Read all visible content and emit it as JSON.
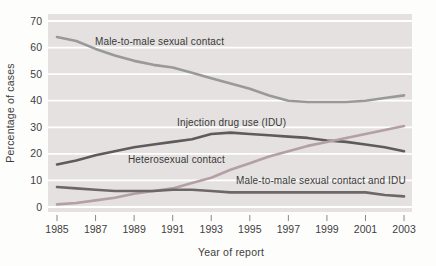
{
  "colors": {
    "page_bg": "#fdfdfc",
    "plot_bg": "#e4e1e0",
    "gridline": "#ffffff",
    "text": "#3f3e3e",
    "tick": "#8a8888"
  },
  "chart_data": {
    "type": "line",
    "xlabel": "Year of report",
    "ylabel": "Percentage of cases",
    "x": [
      1985,
      1986,
      1987,
      1988,
      1989,
      1990,
      1991,
      1992,
      1993,
      1994,
      1995,
      1996,
      1997,
      1998,
      1999,
      2000,
      2001,
      2002,
      2003
    ],
    "x_tick_labels": [
      "1985",
      "1987",
      "1989",
      "1991",
      "1993",
      "1995",
      "1997",
      "1999",
      "2001",
      "2003"
    ],
    "y_ticks": [
      0,
      10,
      20,
      30,
      40,
      50,
      60,
      70
    ],
    "y_tick_labels": [
      "0",
      "10",
      "20",
      "30",
      "40",
      "50",
      "60",
      "70"
    ],
    "xlim": [
      1985,
      2003
    ],
    "ylim": [
      0,
      70
    ],
    "grid": "horizontal-white-on-gray-panel",
    "legend_position": "inline-annotations",
    "series": [
      {
        "name": "Male-to-male sexual contact",
        "color": "#9a999a",
        "values": [
          64,
          62.5,
          59.5,
          57,
          55,
          53.5,
          52.5,
          50.5,
          48.5,
          46.5,
          44.5,
          42,
          40,
          39.5,
          39.5,
          39.5,
          40,
          41,
          42
        ]
      },
      {
        "name": "Injection drug use (IDU)",
        "color": "#5f5b5c",
        "values": [
          16,
          17.5,
          19.5,
          21,
          22.5,
          23.5,
          24.5,
          25.5,
          27.5,
          28,
          27.5,
          27,
          26.5,
          26,
          25,
          24.5,
          23.5,
          22.5,
          21
        ]
      },
      {
        "name": "Heterosexual contact",
        "color": "#b49fa4",
        "values": [
          1,
          1.5,
          2.5,
          3.5,
          5,
          6,
          7,
          9,
          11,
          14,
          16.5,
          19,
          21,
          23,
          24.5,
          26,
          27.5,
          29,
          30.5
        ]
      },
      {
        "name": "Male-to-male sexual contact and IDU",
        "color": "#6d6768",
        "values": [
          7.5,
          7,
          6.5,
          6,
          6,
          6,
          6.5,
          6.5,
          6,
          5.5,
          5.5,
          5.5,
          5.5,
          5.5,
          5.5,
          5.5,
          5.5,
          4.5,
          4
        ]
      }
    ]
  }
}
